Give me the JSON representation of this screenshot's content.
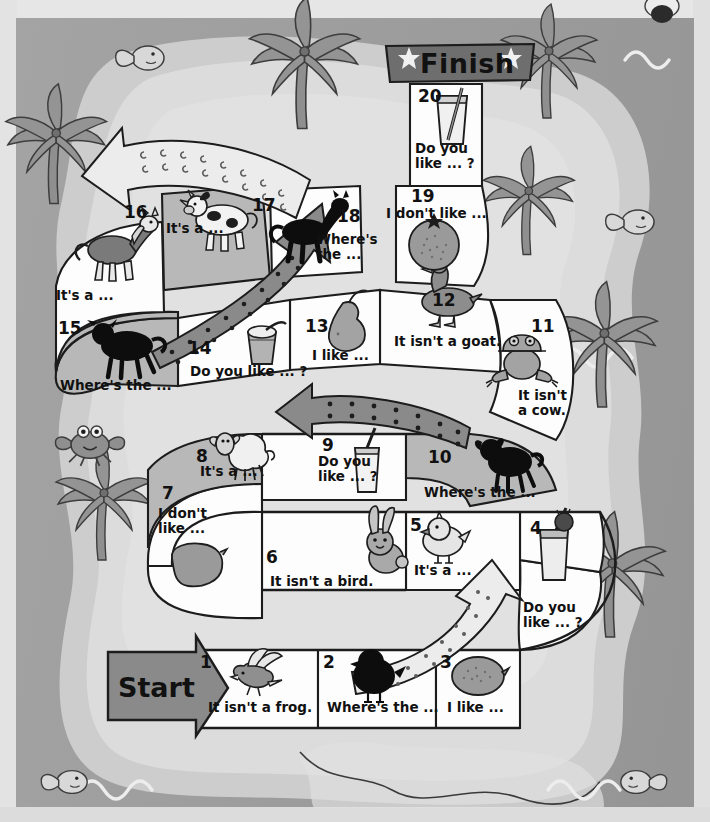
{
  "board": {
    "title": "English board game - farm animals and food",
    "start_label": "Start",
    "finish_label": "Finish",
    "colors": {
      "sea": "#9e9e9e",
      "island": "#dcdcdc",
      "sand": "#cdcdcd",
      "tile_light": "#fdfdfd",
      "tile_dark": "#b9b9b9",
      "banner": "#6e6e6e",
      "arrow": "#8a8a8a",
      "ink": "#111111",
      "paper": "#e3e3e3"
    },
    "tiles": [
      {
        "n": "1",
        "text": "It isn't a frog.",
        "icon": "flying-bird-icon",
        "shade": "light"
      },
      {
        "n": "2",
        "text": "Where's the ...",
        "icon": "chick-silhouette-icon",
        "shade": "light"
      },
      {
        "n": "3",
        "text": "I like ...",
        "icon": "lemon-icon",
        "shade": "light"
      },
      {
        "n": "4",
        "text": "Do you\nlike ... ?",
        "icon": "milkshake-icon",
        "shade": "light"
      },
      {
        "n": "5",
        "text": "It's a ...",
        "icon": "chick-icon",
        "shade": "light"
      },
      {
        "n": "6",
        "text": "It isn't a bird.",
        "icon": "rabbit-icon",
        "shade": "light"
      },
      {
        "n": "7",
        "text": "I don't\nlike ...",
        "icon": "potato-icon",
        "shade": "light"
      },
      {
        "n": "8",
        "text": "It's a ...",
        "icon": "sheep-icon",
        "shade": "dark"
      },
      {
        "n": "9",
        "text": "Do you\nlike ... ?",
        "icon": "milk-glass-icon",
        "shade": "light"
      },
      {
        "n": "10",
        "text": "Where's the ...",
        "icon": "lamb-silhouette-icon",
        "shade": "dark"
      },
      {
        "n": "11",
        "text": "It isn't\na cow.",
        "icon": "frog-icon",
        "shade": "light"
      },
      {
        "n": "12",
        "text": "It isn't a goat.",
        "icon": "duck-icon",
        "shade": "light"
      },
      {
        "n": "13",
        "text": "I like ...",
        "icon": "pear-icon",
        "shade": "light"
      },
      {
        "n": "14",
        "text": "Do you like ... ?",
        "icon": "yogurt-cup-icon",
        "shade": "light"
      },
      {
        "n": "15",
        "text": "Where's the ...",
        "icon": "cow-silhouette-icon",
        "shade": "dark"
      },
      {
        "n": "16",
        "text": "It's a ...",
        "icon": "horse-icon",
        "shade": "light"
      },
      {
        "n": "17",
        "text": "It's a ...",
        "icon": "cow-icon",
        "shade": "dark"
      },
      {
        "n": "18",
        "text": "Where's\nthe ...",
        "icon": "horse-silhouette-icon",
        "shade": "light"
      },
      {
        "n": "19",
        "text": "I don't like ...",
        "icon": "orange-icon",
        "shade": "light"
      },
      {
        "n": "20",
        "text": "Do you\nlike ... ?",
        "icon": "juice-glass-icon",
        "shade": "light"
      }
    ],
    "decor": [
      {
        "name": "palm-tree",
        "note": "top-left palm"
      },
      {
        "name": "palm-tree",
        "note": "left-mid palm"
      },
      {
        "name": "palm-tree",
        "note": "bottom-left palm"
      },
      {
        "name": "palm-tree",
        "note": "top-centre palm"
      },
      {
        "name": "palm-tree",
        "note": "top-right palm"
      },
      {
        "name": "palm-tree",
        "note": "right-mid palm"
      },
      {
        "name": "palm-tree",
        "note": "bottom-right palm"
      },
      {
        "name": "crab",
        "note": "left shore crab"
      },
      {
        "name": "fish",
        "note": "top-left fish"
      },
      {
        "name": "fish",
        "note": "right fish"
      },
      {
        "name": "fish",
        "note": "bottom-left fish"
      },
      {
        "name": "fish",
        "note": "bottom-right fish"
      },
      {
        "name": "waves",
        "note": "sea wave marks"
      }
    ]
  }
}
